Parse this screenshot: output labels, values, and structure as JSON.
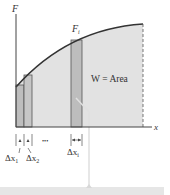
{
  "figure": {
    "axes": {
      "y_label": "F",
      "x_label": "x"
    },
    "curve_label": "F",
    "curve_label_sub": "i",
    "area_label": "W = Area",
    "ellipsis": "•••",
    "delta_labels": [
      {
        "base": "Δx",
        "sub": "1"
      },
      {
        "base": "Δx",
        "sub": "2"
      },
      {
        "base": "Δx",
        "sub": "i"
      }
    ],
    "colors": {
      "area_fill": "#e2e2e2",
      "bar_fill": "#bdbdbd",
      "bar_stroke": "#444444",
      "curve": "#333333",
      "axis": "#444444",
      "pointer": "#dddddd",
      "bottom_bar": "#e6e6e6"
    }
  }
}
